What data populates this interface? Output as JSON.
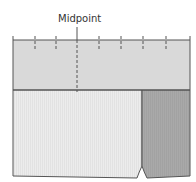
{
  "diagram": {
    "midpoint_label": "Midpoint",
    "tick_count": 9,
    "colors": {
      "upper_band": "#d9d9d9",
      "lower_left": "#ececec",
      "lower_right": "#a9a9a9",
      "outline": "#555555",
      "background": "#ffffff"
    }
  }
}
